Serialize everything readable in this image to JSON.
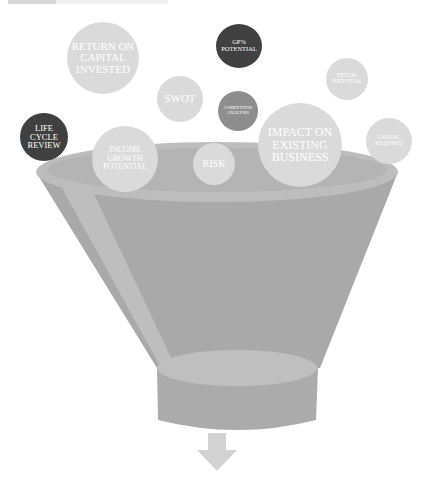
{
  "diagram": {
    "type": "funnel",
    "colors": {
      "funnel_body": "#a9a9a9",
      "funnel_rim": "#bdbdbd",
      "funnel_inner": "#b4b4b4",
      "highlight": "#c2c2c2",
      "bubble_light": "#dadada",
      "bubble_mid": "#8e8e8e",
      "bubble_dark": "#404040",
      "arrow": "#d3d3d3"
    },
    "bubbles": [
      {
        "id": "return-on-capital",
        "label": "RETURN ON\nCAPITAL\nINVESTED",
        "shade": "light"
      },
      {
        "id": "gp-potential",
        "label": "GP%\nPOTENTIAL",
        "shade": "dark"
      },
      {
        "id": "ebitda-potential",
        "label": "EBITDA\nPOTENTIAL",
        "shade": "light"
      },
      {
        "id": "swot",
        "label": "SWOT",
        "shade": "light"
      },
      {
        "id": "competitor-analysis",
        "label": "COMPETITOR\nANALYSIS",
        "shade": "mid"
      },
      {
        "id": "life-cycle-review",
        "label": "LIFE\nCYCLE\nREVIEW",
        "shade": "dark"
      },
      {
        "id": "impact-existing-business",
        "label": "IMPACT ON\nEXISTING\nBUSINESS",
        "shade": "light"
      },
      {
        "id": "capital-required",
        "label": "CAPITAL\nREQUIRED",
        "shade": "light"
      },
      {
        "id": "income-growth-potential",
        "label": "INCOME\nGROWTH\nPOTENTIAL",
        "shade": "light"
      },
      {
        "id": "risk",
        "label": "RISK",
        "shade": "light"
      }
    ]
  }
}
